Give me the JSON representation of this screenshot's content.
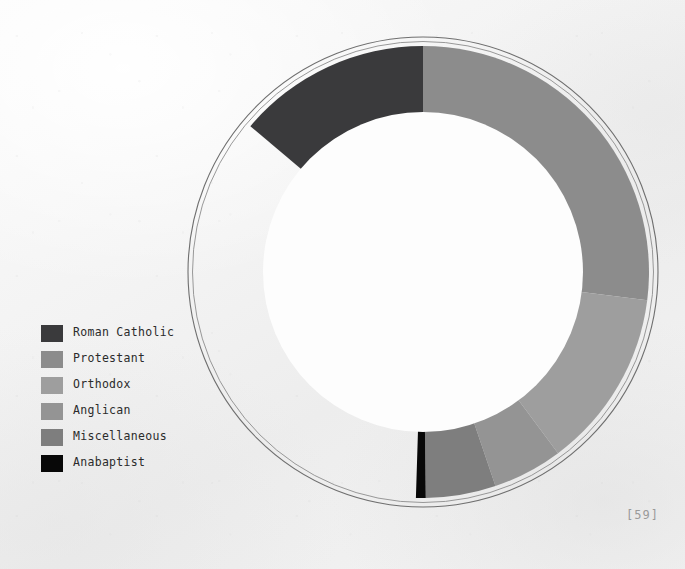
{
  "page": {
    "folio": "[59]",
    "background_color": "#f2f2f2"
  },
  "legend": {
    "position": "left-middle",
    "items": [
      {
        "label": "Roman Catholic",
        "color": "#3a3a3c",
        "swatch_icon": "color-swatch-icon"
      },
      {
        "label": "Protestant",
        "color": "#8c8c8c",
        "swatch_icon": "color-swatch-icon"
      },
      {
        "label": "Orthodox",
        "color": "#9e9e9e",
        "swatch_icon": "color-swatch-icon"
      },
      {
        "label": "Anglican",
        "color": "#949494",
        "swatch_icon": "color-swatch-icon"
      },
      {
        "label": "Miscellaneous",
        "color": "#7e7e7e",
        "swatch_icon": "color-swatch-icon"
      },
      {
        "label": "Anabaptist",
        "color": "#080808",
        "swatch_icon": "color-swatch-icon"
      }
    ]
  },
  "chart_data": {
    "type": "pie",
    "variant": "donut",
    "title": "",
    "subtitle": "",
    "xlabel": "",
    "ylabel": "",
    "grid": false,
    "legend_position": "left",
    "start_angle_deg": 0,
    "direction": "clockwise",
    "hole_ratio": 0.71,
    "units": "percent",
    "labels": [
      "Roman Catholic",
      "Protestant",
      "Orthodox",
      "Anglican",
      "Miscellaneous",
      "Anabaptist"
    ],
    "values": [
      49.5,
      27.0,
      12.8,
      5.0,
      5.0,
      0.7
    ],
    "colors": [
      "#3a3a3c",
      "#8c8c8c",
      "#9e9e9e",
      "#949494",
      "#7e7e7e",
      "#080808"
    ],
    "slices": [
      {
        "label": "Roman Catholic",
        "value": 49.5,
        "color": "#3a3a3c",
        "start_deg": 310.2,
        "end_deg": 360.0,
        "order": 6
      },
      {
        "label": "Protestant",
        "value": 27.0,
        "color": "#8c8c8c",
        "start_deg": 0.0,
        "end_deg": 97.2,
        "order": 1
      },
      {
        "label": "Orthodox",
        "value": 12.8,
        "color": "#9e9e9e",
        "start_deg": 97.2,
        "end_deg": 143.3,
        "order": 2
      },
      {
        "label": "Anglican",
        "value": 5.0,
        "color": "#949494",
        "start_deg": 143.3,
        "end_deg": 161.3,
        "order": 3
      },
      {
        "label": "Miscellaneous",
        "value": 5.0,
        "color": "#7e7e7e",
        "start_deg": 161.3,
        "end_deg": 179.3,
        "order": 4
      },
      {
        "label": "Anabaptist",
        "value": 0.7,
        "color": "#080808",
        "start_deg": 179.3,
        "end_deg": 181.8,
        "order": 5
      }
    ],
    "geometry": {
      "center_x": 423,
      "center_y": 272,
      "outer_radius": 226,
      "inner_radius": 160,
      "ring_line_radius": 235,
      "ring_line_color": "#6f6f6f"
    }
  }
}
